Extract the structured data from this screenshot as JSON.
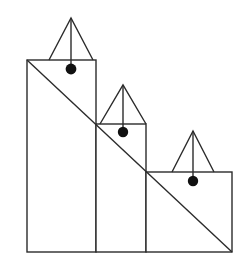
{
  "figure": {
    "canvas": {
      "width": 250,
      "height": 277,
      "background": "#ffffff"
    },
    "stroke_color": "#2b2b2b",
    "dot_color": "#111111",
    "stroke_width": 1.4,
    "baseline_y": 252,
    "bars": [
      {
        "name": "bar-left",
        "x": 27,
        "top_y": 60,
        "width": 69,
        "height": 192,
        "triangle": {
          "apex_x": 71,
          "apex_y": 18,
          "base_left_x": 49,
          "base_right_x": 93,
          "base_y": 60
        },
        "dot": {
          "cx": 71,
          "cy": 69,
          "r": 5.4
        },
        "stem": {
          "x": 71,
          "y1": 18,
          "y2": 69
        }
      },
      {
        "name": "bar-middle",
        "x": 96,
        "top_y": 124,
        "width": 50,
        "height": 128,
        "triangle": {
          "apex_x": 123,
          "apex_y": 85,
          "base_left_x": 100,
          "base_right_x": 146,
          "base_y": 124
        },
        "dot": {
          "cx": 123,
          "cy": 132,
          "r": 5.2
        },
        "stem": {
          "x": 123,
          "y1": 85,
          "y2": 132
        }
      },
      {
        "name": "bar-right",
        "x": 146,
        "top_y": 172,
        "width": 86,
        "height": 80,
        "triangle": {
          "apex_x": 193,
          "apex_y": 131,
          "base_left_x": 172,
          "base_right_x": 214,
          "base_y": 172
        },
        "dot": {
          "cx": 193,
          "cy": 181,
          "r": 5.2
        },
        "stem": {
          "x": 193,
          "y1": 131,
          "y2": 181
        }
      }
    ],
    "diagonal": {
      "x1": 27,
      "y1": 60,
      "x2": 232,
      "y2": 252
    }
  }
}
